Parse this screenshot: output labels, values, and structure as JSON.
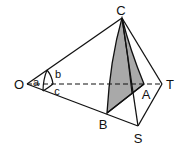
{
  "diagram": {
    "type": "geometry",
    "colors": {
      "stroke": "#111111",
      "shade": "#a9a9a9",
      "background": "#ffffff"
    },
    "points": {
      "O": {
        "label": "O",
        "x": 27,
        "y": 84
      },
      "C": {
        "label": "C",
        "x": 122,
        "y": 18
      },
      "T": {
        "label": "T",
        "x": 162,
        "y": 84
      },
      "S": {
        "label": "S",
        "x": 138,
        "y": 126
      },
      "B": {
        "label": "B",
        "x": 107,
        "y": 113
      },
      "A": {
        "label": "A",
        "x": 144,
        "y": 84
      }
    },
    "angle_labels": {
      "a": "a",
      "b": "b",
      "c": "c"
    },
    "edges": [
      {
        "from": "O",
        "to": "C",
        "style": "solid"
      },
      {
        "from": "O",
        "to": "S",
        "style": "solid"
      },
      {
        "from": "O",
        "to": "T",
        "style": "dashed"
      },
      {
        "from": "C",
        "to": "T",
        "style": "solid"
      },
      {
        "from": "T",
        "to": "S",
        "style": "solid"
      },
      {
        "from": "C",
        "to": "S",
        "style": "solid"
      },
      {
        "from": "B",
        "to": "A",
        "style": "solid"
      }
    ],
    "shaded_region": [
      "C",
      "B",
      "A"
    ]
  }
}
